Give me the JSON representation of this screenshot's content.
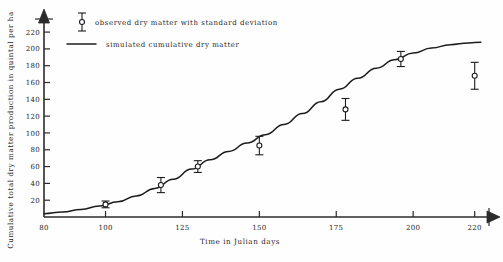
{
  "figure": {
    "background_color": "#fefefe",
    "ink_color": "#1c1c1c"
  },
  "legend": {
    "position": "top-left-inside",
    "entries": [
      {
        "label": "observed dry matter with standard deviation",
        "marker": "errorbar-open-circle-icon"
      },
      {
        "label": "simulated cumulative dry matter",
        "marker": "solid-line-icon"
      }
    ]
  },
  "chart_data": {
    "type": "line",
    "title": "",
    "subtitle": "",
    "xlabel": "Time in Julian days",
    "ylabel": "Cumulative total dry matter production in quintal per ha",
    "xlim": [
      80,
      224
    ],
    "ylim": [
      0,
      232
    ],
    "grid": false,
    "xticks": [
      80,
      100,
      125,
      150,
      175,
      200,
      220
    ],
    "xtick_labels": [
      "80",
      "100",
      "125",
      "150",
      "175",
      "200",
      "220"
    ],
    "yticks": [
      20,
      40,
      60,
      80,
      100,
      120,
      140,
      160,
      180,
      200,
      220
    ],
    "ytick_labels": [
      "20",
      "40",
      "60",
      "80",
      "100",
      "120",
      "140",
      "160",
      "180",
      "200",
      "220"
    ],
    "axis_arrows": {
      "x_right": true,
      "y_top": true
    },
    "series": [
      {
        "name": "simulated cumulative dry matter",
        "type": "line",
        "x": [
          80,
          86,
          92,
          98,
          104,
          110,
          116,
          122,
          128,
          134,
          140,
          146,
          152,
          158,
          164,
          170,
          176,
          182,
          188,
          194,
          200,
          206,
          212,
          218,
          222
        ],
        "values": [
          4,
          6,
          9,
          13,
          18,
          25,
          34,
          45,
          57,
          68,
          78,
          88,
          98,
          110,
          123,
          137,
          152,
          165,
          177,
          187,
          195,
          201,
          205,
          207,
          208
        ]
      },
      {
        "name": "observed dry matter with standard deviation",
        "type": "scatter",
        "marker": "open-circle",
        "x": [
          100,
          118,
          130,
          150,
          178,
          196,
          220
        ],
        "values": [
          15,
          38,
          60,
          85,
          128,
          188,
          168
        ],
        "errors": [
          4,
          9,
          7,
          11,
          13,
          9,
          16
        ]
      }
    ]
  }
}
